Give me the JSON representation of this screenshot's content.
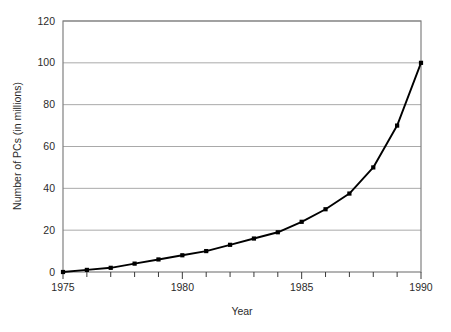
{
  "chart_data": {
    "type": "line",
    "title": "",
    "xlabel": "Year",
    "ylabel": "Number of PCs (in millions)",
    "xlim": [
      1975,
      1990
    ],
    "ylim": [
      0,
      120
    ],
    "grid": "horizontal",
    "legend": "none",
    "marker": "filled-square",
    "line_color": "#000000",
    "grid_color": "#a9a9a9",
    "frame_color": "#808080",
    "x": [
      1975,
      1976,
      1977,
      1978,
      1979,
      1980,
      1981,
      1982,
      1983,
      1984,
      1985,
      1986,
      1987,
      1988,
      1989,
      1990
    ],
    "values": [
      0,
      1,
      2,
      4,
      6,
      8,
      10,
      13,
      16,
      19,
      24,
      30,
      37.5,
      50,
      70,
      100
    ],
    "series": [
      {
        "name": "Number of PCs (in millions)",
        "values": [
          0,
          1,
          2,
          4,
          6,
          8,
          10,
          13,
          16,
          19,
          24,
          30,
          37.5,
          50,
          70,
          100
        ]
      }
    ],
    "yticks": [
      0,
      20,
      40,
      60,
      80,
      100,
      120
    ],
    "ytick_labels": [
      "0",
      "20",
      "40",
      "60",
      "80",
      "100",
      "120"
    ],
    "xticks": [
      1975,
      1976,
      1977,
      1978,
      1979,
      1980,
      1981,
      1982,
      1983,
      1984,
      1985,
      1986,
      1987,
      1988,
      1989,
      1990
    ],
    "xtick_labels_major": [
      "1975",
      "1980",
      "1985",
      "1990"
    ],
    "xticks_major": [
      1975,
      1980,
      1985,
      1990
    ]
  }
}
